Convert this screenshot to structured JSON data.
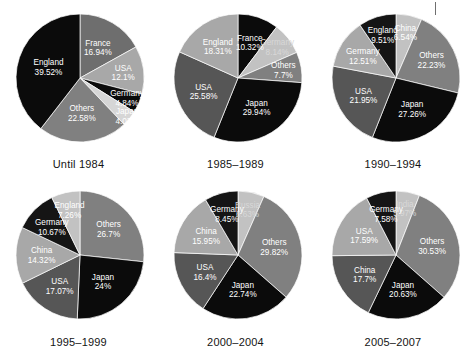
{
  "figure": {
    "background": "#ffffff",
    "artifact": {
      "name": "top-right-tick-mark",
      "color": "#6f6f6f"
    }
  },
  "palette": {
    "black": "#0b0b0b",
    "near_black": "#151515",
    "dark_gray": "#3f3f3f",
    "mid_dark_gray": "#565656",
    "mid_gray": "#6e6e6e",
    "gray": "#808080",
    "light_gray": "#a8a8a8",
    "lighter_gray": "#c2c2c2",
    "pale_gray": "#d6d6d6",
    "label_light": "#ffffff",
    "label_dark": "#000000",
    "caption": "#141414"
  },
  "chart_data": [
    {
      "type": "pie",
      "title": "Until 1984",
      "units": "percent",
      "start_angle_deg": 0,
      "direction": "clockwise",
      "categories": [
        "France",
        "USA",
        "Germany",
        "Japan",
        "Others",
        "England"
      ],
      "values": [
        16.94,
        12.1,
        4.84,
        4.03,
        22.58,
        39.52
      ],
      "labels": [
        "France\n16.94%",
        "USA\n12.1%",
        "Germany\n4.84%",
        "Japan\n4.03%",
        "Others\n22.58%",
        "England\n39.52%"
      ],
      "slices": [
        {
          "name": "France",
          "value": 16.94,
          "value_text": "16.94%",
          "color": "#6e6e6e",
          "text_color": "#ffffff"
        },
        {
          "name": "USA",
          "value": 12.1,
          "value_text": "12.1%",
          "color": "#a8a8a8",
          "text_color": "#ffffff"
        },
        {
          "name": "Germany",
          "value": 4.84,
          "value_text": "4.84%",
          "color": "#0b0b0b",
          "text_color": "#ffffff"
        },
        {
          "name": "Japan",
          "value": 4.03,
          "value_text": "4.03%",
          "color": "#d6d6d6",
          "text_color": "#ffffff"
        },
        {
          "name": "Others",
          "value": 22.58,
          "value_text": "22.58%",
          "color": "#808080",
          "text_color": "#ffffff"
        },
        {
          "name": "England",
          "value": 39.52,
          "value_text": "39.52%",
          "color": "#0b0b0b",
          "text_color": "#ffffff"
        }
      ]
    },
    {
      "type": "pie",
      "title": "1985–1989",
      "units": "percent",
      "start_angle_deg": 0,
      "direction": "clockwise",
      "categories": [
        "France",
        "Germany",
        "Others",
        "Japan",
        "USA",
        "England"
      ],
      "values": [
        10.32,
        8.14,
        7.7,
        29.94,
        25.58,
        18.31
      ],
      "labels": [
        "France\n10.32%",
        "Germany\n8.14%",
        "Others\n7.7%",
        "Japan\n29.94%",
        "USA\n25.58%",
        "England\n18.31%"
      ],
      "slices": [
        {
          "name": "France",
          "value": 10.32,
          "value_text": "10.32%",
          "color": "#0b0b0b",
          "text_color": "#ffffff"
        },
        {
          "name": "Germany",
          "value": 8.14,
          "value_text": "8.14%",
          "color": "#c2c2c2",
          "text_color": "#d8d8d8"
        },
        {
          "name": "Others",
          "value": 7.7,
          "value_text": "7.7%",
          "color": "#808080",
          "text_color": "#ffffff"
        },
        {
          "name": "Japan",
          "value": 29.94,
          "value_text": "29.94%",
          "color": "#0b0b0b",
          "text_color": "#ffffff"
        },
        {
          "name": "USA",
          "value": 25.58,
          "value_text": "25.58%",
          "color": "#565656",
          "text_color": "#ffffff"
        },
        {
          "name": "England",
          "value": 18.31,
          "value_text": "18.31%",
          "color": "#a8a8a8",
          "text_color": "#ffffff"
        }
      ]
    },
    {
      "type": "pie",
      "title": "1990–1994",
      "units": "percent",
      "start_angle_deg": 0,
      "direction": "clockwise",
      "categories": [
        "China",
        "Others",
        "Japan",
        "USA",
        "Germany",
        "England"
      ],
      "values": [
        6.54,
        22.23,
        27.26,
        21.95,
        12.51,
        9.51
      ],
      "labels": [
        "China\n6.54%",
        "Others\n22.23%",
        "Japan\n27.26%",
        "USA\n21.95%",
        "Germany\n12.51%",
        "England\n9.51%"
      ],
      "slices": [
        {
          "name": "China",
          "value": 6.54,
          "value_text": "6.54%",
          "color": "#c2c2c2",
          "text_color": "#ffffff"
        },
        {
          "name": "Others",
          "value": 22.23,
          "value_text": "22.23%",
          "color": "#808080",
          "text_color": "#ffffff"
        },
        {
          "name": "Japan",
          "value": 27.26,
          "value_text": "27.26%",
          "color": "#0b0b0b",
          "text_color": "#ffffff"
        },
        {
          "name": "USA",
          "value": 21.95,
          "value_text": "21.95%",
          "color": "#565656",
          "text_color": "#ffffff"
        },
        {
          "name": "Germany",
          "value": 12.51,
          "value_text": "12.51%",
          "color": "#a8a8a8",
          "text_color": "#ffffff"
        },
        {
          "name": "England",
          "value": 9.51,
          "value_text": "9.51%",
          "color": "#151515",
          "text_color": "#ffffff"
        }
      ]
    },
    {
      "type": "pie",
      "title": "1995–1999",
      "units": "percent",
      "start_angle_deg": 0,
      "direction": "clockwise",
      "categories": [
        "Others",
        "Japan",
        "USA",
        "China",
        "Germany",
        "England"
      ],
      "values": [
        26.7,
        24,
        17.07,
        14.32,
        10.67,
        7.26
      ],
      "labels": [
        "Others\n26.7%",
        "Japan\n24%",
        "USA\n17.07%",
        "China\n14.32%",
        "Germany\n10.67%",
        "England\n7.26%"
      ],
      "slices": [
        {
          "name": "Others",
          "value": 26.7,
          "value_text": "26.7%",
          "color": "#808080",
          "text_color": "#ffffff"
        },
        {
          "name": "Japan",
          "value": 24,
          "value_text": "24%",
          "color": "#0b0b0b",
          "text_color": "#ffffff"
        },
        {
          "name": "USA",
          "value": 17.07,
          "value_text": "17.07%",
          "color": "#565656",
          "text_color": "#ffffff"
        },
        {
          "name": "China",
          "value": 14.32,
          "value_text": "14.32%",
          "color": "#a8a8a8",
          "text_color": "#ffffff"
        },
        {
          "name": "Germany",
          "value": 10.67,
          "value_text": "10.67%",
          "color": "#151515",
          "text_color": "#ffffff"
        },
        {
          "name": "England",
          "value": 7.26,
          "value_text": "7.26%",
          "color": "#c2c2c2",
          "text_color": "#ffffff"
        }
      ]
    },
    {
      "type": "pie",
      "title": "2000–2004",
      "units": "percent",
      "start_angle_deg": 0,
      "direction": "clockwise",
      "categories": [
        "Russia",
        "Others",
        "Japan",
        "USA",
        "China",
        "Germany"
      ],
      "values": [
        6.63,
        29.82,
        22.74,
        16.4,
        15.95,
        8.45
      ],
      "labels": [
        "Russia\n6.63%",
        "Others\n29.82%",
        "Japan\n22.74%",
        "USA\n16.4%",
        "China\n15.95%",
        "Germany\n8.45%"
      ],
      "slices": [
        {
          "name": "Russia",
          "value": 6.63,
          "value_text": "6.63%",
          "color": "#c2c2c2",
          "text_color": "#d8d8d8"
        },
        {
          "name": "Others",
          "value": 29.82,
          "value_text": "29.82%",
          "color": "#808080",
          "text_color": "#ffffff"
        },
        {
          "name": "Japan",
          "value": 22.74,
          "value_text": "22.74%",
          "color": "#0b0b0b",
          "text_color": "#ffffff"
        },
        {
          "name": "USA",
          "value": 16.4,
          "value_text": "16.4%",
          "color": "#565656",
          "text_color": "#ffffff"
        },
        {
          "name": "China",
          "value": 15.95,
          "value_text": "15.95%",
          "color": "#a8a8a8",
          "text_color": "#ffffff"
        },
        {
          "name": "Germany",
          "value": 8.45,
          "value_text": "8.45%",
          "color": "#151515",
          "text_color": "#ffffff"
        }
      ]
    },
    {
      "type": "pie",
      "title": "2005–2007",
      "units": "percent",
      "start_angle_deg": 0,
      "direction": "clockwise",
      "categories": [
        "India",
        "Others",
        "Japan",
        "China",
        "USA",
        "Germany"
      ],
      "values": [
        5.97,
        30.53,
        20.63,
        17.7,
        17.59,
        7.58
      ],
      "labels": [
        "India\n5.97%",
        "Others\n30.53%",
        "Japan\n20.63%",
        "China\n17.7%",
        "USA\n17.59%",
        "Germany\n7.58%"
      ],
      "slices": [
        {
          "name": "India",
          "value": 5.97,
          "value_text": "5.97%",
          "color": "#c2c2c2",
          "text_color": "#d8d8d8"
        },
        {
          "name": "Others",
          "value": 30.53,
          "value_text": "30.53%",
          "color": "#808080",
          "text_color": "#ffffff"
        },
        {
          "name": "Japan",
          "value": 20.63,
          "value_text": "20.63%",
          "color": "#0b0b0b",
          "text_color": "#ffffff"
        },
        {
          "name": "China",
          "value": 17.7,
          "value_text": "17.7%",
          "color": "#565656",
          "text_color": "#ffffff"
        },
        {
          "name": "USA",
          "value": 17.59,
          "value_text": "17.59%",
          "color": "#a8a8a8",
          "text_color": "#ffffff"
        },
        {
          "name": "Germany",
          "value": 7.58,
          "value_text": "7.58%",
          "color": "#151515",
          "text_color": "#ffffff"
        }
      ]
    }
  ]
}
